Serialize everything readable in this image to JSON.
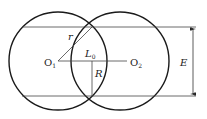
{
  "diagram": {
    "type": "two-intersecting-circles",
    "labels": {
      "center1": "O",
      "center1_sub": "1",
      "center2": "O",
      "center2_sub": "2",
      "small_radius": "r",
      "center_distance": "L",
      "center_distance_sub": "0",
      "half_chord": "R",
      "overlap_width": "E"
    },
    "colors": {
      "stroke": "#1a1a1a",
      "thin": "#444444",
      "background": "#ffffff"
    }
  }
}
